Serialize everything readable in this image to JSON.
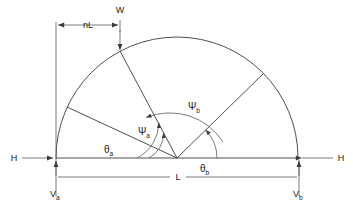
{
  "figure": {
    "type": "engineering-diagram",
    "background_color": "#ffffff",
    "line_color": "#3b3b3b",
    "text_color": "#1a1a1a"
  },
  "labels": {
    "span_dimension": "L",
    "rise_offset_dimension": "nL",
    "load_label": "W",
    "horizontal_reaction_left": "H",
    "horizontal_reaction_right": "H",
    "vertical_reaction_left_base": "V",
    "vertical_reaction_left_sub": "a",
    "vertical_reaction_right_base": "V",
    "vertical_reaction_right_sub": "b",
    "angle_theta_a_base": "θ",
    "angle_theta_a_sub": "a",
    "angle_theta_b_base": "θ",
    "angle_theta_b_sub": "b",
    "angle_psi_a_base": "Ψ",
    "angle_psi_a_sub": "a",
    "angle_psi_b_base": "Ψ",
    "angle_psi_b_sub": "b"
  },
  "geometry": {
    "center_x": 177,
    "center_y": 158,
    "outer_radius": 122,
    "left_support_x": 56,
    "right_support_x": 299,
    "baseline_y": 158,
    "span_dimension_line_y": 177,
    "nl_dimension_line_y": 25,
    "w_arrow_x": 120,
    "w_arrow_tip_y": 53,
    "radial_angles_deg": [
      155,
      125,
      42
    ],
    "psi_a_arc_radius": 40,
    "psi_b_arc_radius": 63,
    "theta_b_arc_radius": 28
  }
}
